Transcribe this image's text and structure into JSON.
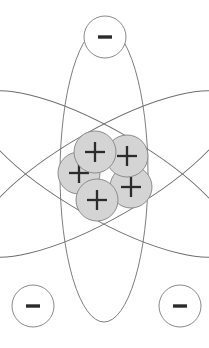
{
  "diagram": {
    "background_color": "#ffffff",
    "width": 209,
    "height": 348
  },
  "nucleus": {
    "label": "nucleus",
    "particle_label": "+",
    "particle_name": "proton",
    "count": 5,
    "fill_color": "#d4d4d4",
    "stroke_color": "#8c8c8c",
    "radius": 21,
    "particles": [
      {
        "name": "proton-top-left",
        "cx": 95,
        "cy": 152,
        "sign": "+"
      },
      {
        "name": "proton-top-right",
        "cx": 127,
        "cy": 156,
        "sign": "+"
      },
      {
        "name": "proton-left",
        "cx": 79,
        "cy": 173,
        "sign": "+"
      },
      {
        "name": "proton-bottom-right",
        "cx": 131,
        "cy": 187,
        "sign": "+"
      },
      {
        "name": "proton-bottom-left",
        "cx": 97,
        "cy": 200,
        "sign": "+"
      }
    ]
  },
  "electrons": {
    "label": "electrons",
    "particle_label": "−",
    "particle_name": "electron",
    "count": 3,
    "fill_color": "#ffffff",
    "stroke_color": "#8a8a8a",
    "radius": 21,
    "particles": [
      {
        "name": "electron-top",
        "cx": 105,
        "cy": 37,
        "sign": "−"
      },
      {
        "name": "electron-bottom-left",
        "cx": 33,
        "cy": 306,
        "sign": "−"
      },
      {
        "name": "electron-bottom-right",
        "cx": 180,
        "cy": 306,
        "sign": "−"
      }
    ]
  },
  "orbits": {
    "label": "electron orbits",
    "count": 3,
    "stroke_color": "#6e6e6e",
    "stroke_width": 0.9,
    "center_x": 104,
    "center_y": 174,
    "semi_major": 148,
    "semi_minor": 44,
    "paths": [
      {
        "name": "orbit-vertical",
        "rotation_deg": 0
      },
      {
        "name": "orbit-tilted-left",
        "rotation_deg": 60
      },
      {
        "name": "orbit-tilted-right",
        "rotation_deg": -60
      }
    ]
  }
}
